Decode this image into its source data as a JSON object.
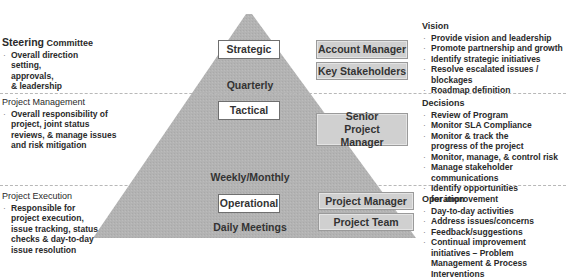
{
  "colors": {
    "pyramid_fill": "#b3b3b3",
    "level_box_fill": "#ffffff",
    "role_box_fill": "#d0d0d0",
    "divider": "#b8b8b8",
    "text": "#2a2a2a"
  },
  "levels": [
    {
      "name": "Strategic",
      "frequency": "Quarterly",
      "roles": [
        "Account Manager",
        "Key Stakeholders"
      ],
      "left_panel": {
        "heading_strong": "Steering",
        "heading_rest": " Committee",
        "bullets": [
          "Overall direction setting,",
          "approvals,",
          "& leadership"
        ]
      },
      "right_panel": {
        "heading": "Vision",
        "bullets": [
          "Provide vision and leadership",
          "Promote partnership and growth",
          "Identify strategic initiatives",
          "Resolve escalated issues / blockages",
          "Roadmap definition"
        ]
      }
    },
    {
      "name": "Tactical",
      "frequency": "Weekly/Monthly",
      "roles": [
        "Senior Project Manager"
      ],
      "left_panel": {
        "heading": "Project Management",
        "bullets": [
          "Overall responsibility of project, joint status reviews, & manage issues and risk mitigation"
        ]
      },
      "right_panel": {
        "heading": "Decisions",
        "bullets": [
          "Review of Program",
          "Monitor SLA Compliance",
          "Monitor & track the progress of the project",
          "Monitor, manage, & control risk",
          "Manage stakeholder communications",
          "Identify opportunities for improvement"
        ]
      }
    },
    {
      "name": "Operational",
      "frequency": "Daily Meetings",
      "roles": [
        "Project Manager",
        "Project Team"
      ],
      "left_panel": {
        "heading": "Project Execution",
        "bullets": [
          "Responsible for project execution, issue tracking, status checks & day-to-day",
          "issue resolution"
        ]
      },
      "right_panel": {
        "heading": "Operation",
        "bullets": [
          "Day-to-day activities",
          "Address issues/concerns",
          "Feedback/suggestions",
          "Continual improvement initiatives – Problem Management & Process Interventions"
        ]
      }
    }
  ]
}
